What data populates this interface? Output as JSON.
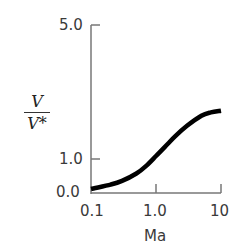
{
  "chart_data": {
    "type": "line",
    "title": "",
    "xlabel": "Ma",
    "ylabel": "V / V*",
    "ylabel_numerator": "V",
    "ylabel_denominator": "V*",
    "x_scale": "log",
    "xlim": [
      0.1,
      10
    ],
    "ylim": [
      0.0,
      5.0
    ],
    "x_ticks": [
      "0.1",
      "1.0",
      "10"
    ],
    "y_ticks": [
      "0.0",
      "1.0",
      "5.0"
    ],
    "grid": false,
    "legend": null,
    "series": [
      {
        "name": "V/V*",
        "x": [
          0.1,
          0.2,
          0.3,
          0.5,
          0.7,
          1.0,
          1.5,
          2.0,
          3.0,
          5.0,
          7.0,
          10.0
        ],
        "y": [
          0.12,
          0.25,
          0.36,
          0.58,
          0.8,
          1.1,
          1.45,
          1.7,
          2.0,
          2.3,
          2.4,
          2.45
        ]
      }
    ]
  }
}
